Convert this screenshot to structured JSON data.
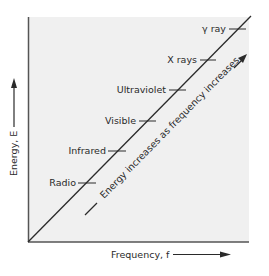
{
  "diagram": {
    "x_axis_label": "Frequency, f",
    "y_axis_label": "Energy, E",
    "diagonal_caption": "Energy increases as frequency increases",
    "background_color": "#f0f0f0",
    "line_color": "#2a2a2a",
    "markers": [
      {
        "label": "Radio"
      },
      {
        "label": "Infrared"
      },
      {
        "label": "Visible"
      },
      {
        "label": "Ultraviolet"
      },
      {
        "label": "X rays"
      },
      {
        "label": "γ ray"
      }
    ]
  }
}
